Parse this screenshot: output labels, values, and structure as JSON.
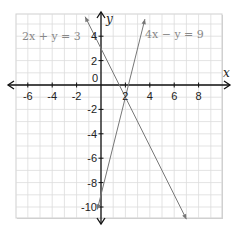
{
  "chart_data": {
    "type": "line",
    "title": "",
    "xlabel": "x",
    "ylabel": "y",
    "xlim": [
      -7,
      10
    ],
    "ylim": [
      -11,
      6
    ],
    "grid": true,
    "x_ticks": [
      -6,
      -4,
      -2,
      2,
      4,
      6,
      8
    ],
    "y_ticks": [
      4,
      2,
      -2,
      -4,
      -6,
      -8,
      -10
    ],
    "origin_label": "0",
    "series": [
      {
        "name": "2x + y = 3",
        "equation": "y = 3 - 2x",
        "label": "2x + y = 3",
        "points": [
          [
            -1.3,
            5.6
          ],
          [
            7.0,
            -11.0
          ]
        ],
        "label_position": "top-left"
      },
      {
        "name": "4x - y = 9",
        "equation": "y = 4x - 9",
        "label": "4x − y = 9",
        "points": [
          [
            -0.3,
            -10.2
          ],
          [
            3.6,
            5.4
          ]
        ],
        "label_position": "top-right"
      }
    ],
    "intersection": [
      2,
      -1
    ]
  },
  "colors": {
    "grid": "#dcdcdc",
    "axis": "#111111",
    "line": "#777777",
    "label": "#888888"
  }
}
